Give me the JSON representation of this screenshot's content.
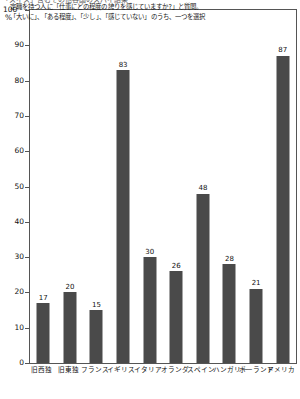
{
  "header": {
    "cutoff_text": "「スイス」含むその他各国のスパイ結果"
  },
  "axis": {
    "y_top_value": "100",
    "y_unit": "%"
  },
  "annotation": {
    "line1": "定職を持つ人に「仕事にどの程度の誇りを感じていますか?」と質問。",
    "line2": "「大いに」、「ある程度」、「少し」、「感じていない」のうち、一つを選択"
  },
  "colors": {
    "bar": "#4a4a4a",
    "frame": "#555555",
    "text": "#111111"
  },
  "chart_data": {
    "type": "bar",
    "title": "",
    "xlabel": "",
    "ylabel": "%",
    "ylim": [
      0,
      100
    ],
    "yticks": [
      0,
      10,
      20,
      30,
      40,
      50,
      60,
      70,
      80,
      90,
      100
    ],
    "ytick_labels": [
      "0",
      "10",
      "20",
      "30",
      "40",
      "50",
      "60",
      "70",
      "80",
      "90",
      "100"
    ],
    "grid": false,
    "legend": "none",
    "categories": [
      "旧西独",
      "旧東独",
      "フランス",
      "イギリス",
      "イタリア",
      "オランダ",
      "スペイン",
      "ハンガリー",
      "ポーランド",
      "アメリカ"
    ],
    "values": [
      17,
      20,
      15,
      83,
      30,
      26,
      48,
      28,
      21,
      87
    ],
    "data_labels": [
      "17",
      "20",
      "15",
      "83",
      "30",
      "26",
      "48",
      "28",
      "21",
      "87"
    ],
    "annotations": [
      "定職を持つ人に「仕事にどの程度の誇りを感じていますか?」と質問。",
      "「大いに」、「ある程度」、「少し」、「感じていない」のうち、一つを選択"
    ]
  }
}
